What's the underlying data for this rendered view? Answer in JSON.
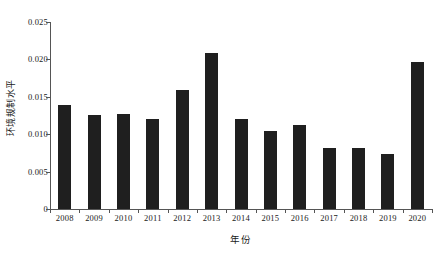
{
  "chart_data": {
    "type": "bar",
    "title": "",
    "xlabel": "年份",
    "ylabel": "环境规制水平",
    "categories": [
      "2008",
      "2009",
      "2010",
      "2011",
      "2012",
      "2013",
      "2014",
      "2015",
      "2016",
      "2017",
      "2018",
      "2019",
      "2020"
    ],
    "values": [
      0.0139,
      0.0126,
      0.0127,
      0.0121,
      0.0159,
      0.0208,
      0.012,
      0.0104,
      0.0112,
      0.0081,
      0.0081,
      0.0073,
      0.0196
    ],
    "ylim": [
      0,
      0.025
    ],
    "y_ticks": [
      0,
      0.005,
      0.01,
      0.015,
      0.02,
      0.025
    ],
    "y_tick_labels": [
      "0",
      "0.005",
      "0.010",
      "0.015",
      "0.020",
      "0.025"
    ],
    "grid": false,
    "legend": false,
    "legend_position": "none",
    "bar_color": "#1f1f1f",
    "axis_color": "#555555",
    "background_color": "#ffffff"
  }
}
